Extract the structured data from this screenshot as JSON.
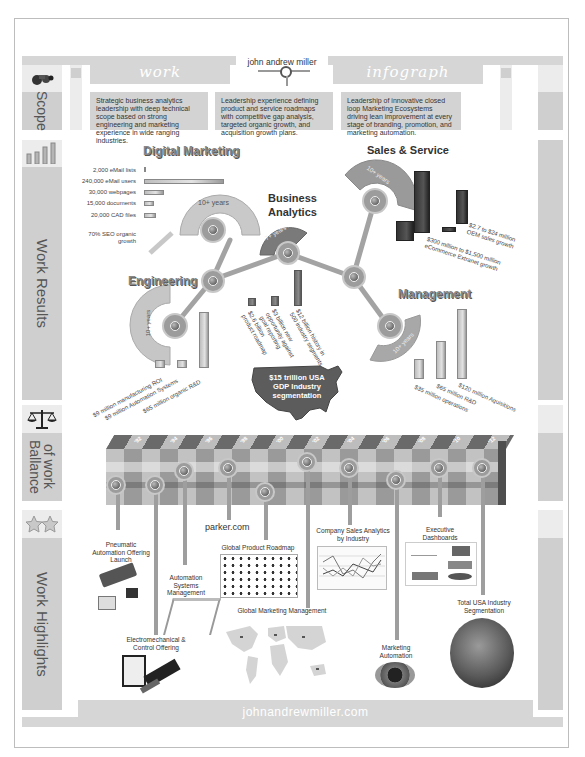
{
  "header": {
    "left_tab": "work",
    "center_title": "john andrew miller",
    "right_tab": "infograph"
  },
  "sidebar": {
    "sections": [
      {
        "label": "Scope",
        "icon": "binoculars-icon"
      },
      {
        "label": "Work Results",
        "icon": "bar-chart-icon"
      },
      {
        "label": "Ballance of work",
        "label_line1": "Ballance",
        "label_line2": "of work",
        "icon": "scales-icon"
      },
      {
        "label": "Work Highlights",
        "icon": "stars-icon"
      }
    ]
  },
  "scope": {
    "boxes": [
      "Strategic business analytics leadership with deep technical scope based on strong engineering and marketing experience in wide ranging industries.",
      "Leadership experience defining product and service roadmaps with competitive gap analysis, targeted organic growth, and acquisition growth plans.",
      "Leadership of innovative closed loop Marketing Ecosystems driving lean improvement at every stage of branding, promotion, and marketing automation."
    ]
  },
  "work_results": {
    "digital_marketing": {
      "title": "Digital Marketing",
      "years": "10+ years",
      "metrics": [
        {
          "label": "2,000 eMail lists",
          "bar": 2
        },
        {
          "label": "240,000 eMail users",
          "bar": 100
        },
        {
          "label": "30,000 webpages",
          "bar": 24
        },
        {
          "label": "15,000 documents",
          "bar": 12
        },
        {
          "label": "20,000 CAD files",
          "bar": 14
        }
      ],
      "seo_label": "70% SEO organic growth"
    },
    "engineering": {
      "title": "Engineering",
      "years": "10+ years",
      "bars": [
        {
          "label": "$9 million manufacturing ROI",
          "height": 9
        },
        {
          "label": "$9 million Automation Systems",
          "height": 9
        },
        {
          "label": "$65 million organic R&D",
          "height": 65
        }
      ]
    },
    "business_analytics": {
      "title_line1": "Business",
      "title_line2": "Analytics",
      "years": "7+ years",
      "bars": [
        {
          "label": "$2.6 billion product roadmap",
          "height": 10
        },
        {
          "label": "$3 billion new opportunity against goal reporting",
          "height": 12
        },
        {
          "label": "$12 billion history in 500 industry segments",
          "height": 45
        }
      ],
      "map_label": "$15 trillion USA GDP Industry segmentation"
    },
    "sales_service": {
      "title": "Sales & Service",
      "years": "10+ years",
      "annotations": [
        "$2.7 to $24 million OEM sales growth",
        "$300 million to $1,500 million eCommerce Extranet growth"
      ]
    },
    "management": {
      "title": "Management",
      "years": "10+ years",
      "bars": [
        {
          "label": "$35 million operations",
          "height": 35
        },
        {
          "label": "$65 million R&D",
          "height": 65
        },
        {
          "label": "$120 million Aquisitions",
          "height": 120
        }
      ]
    }
  },
  "balance_of_work": {
    "years": [
      "'92",
      "'94",
      "'96",
      "'98",
      "'00",
      "'02",
      "'04",
      "'06",
      "'08",
      "'10",
      "'12"
    ]
  },
  "highlights": {
    "items": [
      {
        "label": "Pneumatic Automation Offering Launch"
      },
      {
        "label": "Electromechanical & Control Offering"
      },
      {
        "label": "Automation Systems Management"
      },
      {
        "label": "parker.com"
      },
      {
        "label": "Global Product Roadmap"
      },
      {
        "label": "Global Marketing Management"
      },
      {
        "label": "Company Sales Analytics by Industry"
      },
      {
        "label": "Marketing Automation"
      },
      {
        "label": "Executive Dashboards"
      },
      {
        "label": "Total USA Industry Segmentation"
      }
    ]
  },
  "footer": {
    "url": "johnandrewmiller.com"
  },
  "colors": {
    "band": "#d6d6d6",
    "panel": "#cfcfcf",
    "light_panel": "#ececec",
    "frame_border": "#bdbdbd",
    "stem": "#9e9e9e"
  }
}
